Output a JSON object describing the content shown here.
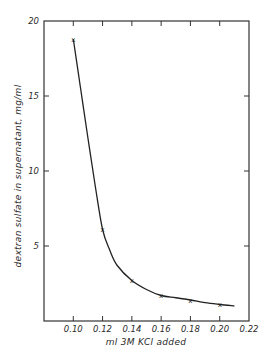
{
  "chart_data": {
    "type": "line",
    "title": "",
    "xlabel": "ml 3M KCl added",
    "ylabel": "dextran sulfate in supernatant, mg/ml",
    "xlim": [
      0.08,
      0.22
    ],
    "ylim": [
      0,
      20
    ],
    "xticks": [
      0.1,
      0.12,
      0.14,
      0.16,
      0.18,
      0.2,
      0.22
    ],
    "xtick_labels": [
      "0.10",
      "0.12",
      "0.14",
      "0.16",
      "0.18",
      "0.20",
      "0.22"
    ],
    "yticks": [
      5,
      10,
      15,
      20
    ],
    "ytick_labels": [
      "5",
      "10",
      "15",
      "20"
    ],
    "grid": false,
    "legend": null,
    "series": [
      {
        "name": "dextran sulfate",
        "marker": "x",
        "x": [
          0.1,
          0.12,
          0.14,
          0.16,
          0.18,
          0.2
        ],
        "values": [
          18.8,
          6.1,
          2.7,
          1.7,
          1.4,
          1.1
        ]
      }
    ],
    "curve": {
      "x": [
        0.1,
        0.105,
        0.11,
        0.115,
        0.12,
        0.125,
        0.13,
        0.14,
        0.15,
        0.16,
        0.17,
        0.18,
        0.19,
        0.2,
        0.21
      ],
      "y": [
        18.8,
        15.5,
        12.2,
        9.0,
        6.1,
        4.7,
        3.7,
        2.7,
        2.1,
        1.7,
        1.55,
        1.4,
        1.22,
        1.1,
        1.0
      ]
    }
  }
}
